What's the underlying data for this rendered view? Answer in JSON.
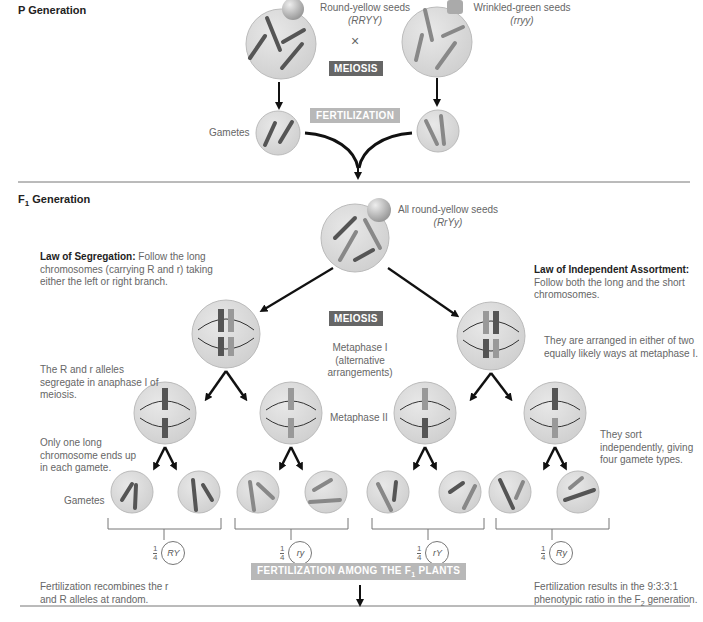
{
  "p_generation": {
    "title": "P Generation",
    "parent1": {
      "label": "Round-yellow seeds",
      "genotype": "(RRYY)"
    },
    "parent2": {
      "label": "Wrinkled-green seeds",
      "genotype": "(rryy)"
    },
    "cross_symbol": "×",
    "meiosis_label": "MEIOSIS",
    "fertilization_label": "FERTILIZATION",
    "gametes_label": "Gametes",
    "gamete1_alleles": [
      "R",
      "Y"
    ],
    "gamete2_alleles": [
      "y",
      "r"
    ]
  },
  "f1_generation": {
    "title_prefix": "F",
    "title_sub": "1",
    "title_suffix": " Generation",
    "offspring": {
      "label": "All round-yellow seeds",
      "genotype": "(RrYy)"
    },
    "law_segregation": {
      "heading": "Law of Segregation:",
      "text": "Follow the long chromosomes (carrying R and r) taking either the left or right branch."
    },
    "law_independent": {
      "heading": "Law of Independent Assortment:",
      "text": "Follow both the long and the short chromosomes."
    },
    "meiosis_label": "MEIOSIS",
    "metaphase1_label": "Metaphase I (alternative arrangements)",
    "metaphase2_label": "Metaphase II",
    "segregate_note": "The R and r alleles segregate in anaphase I of meiosis.",
    "arranged_note": "They are arranged in either of two equally likely ways at metaphase I.",
    "one_long_note": "Only one long chromosome ends up in each gamete.",
    "sort_note": "They sort independently, giving four gamete types.",
    "gametes_label": "Gametes",
    "gamete_types": [
      {
        "fraction_num": "1",
        "fraction_den": "4",
        "genotype": "RY"
      },
      {
        "fraction_num": "1",
        "fraction_den": "4",
        "genotype": "ry"
      },
      {
        "fraction_num": "1",
        "fraction_den": "4",
        "genotype": "rY"
      },
      {
        "fraction_num": "1",
        "fraction_den": "4",
        "genotype": "Ry"
      }
    ],
    "fertilization_among_prefix": "FERTILIZATION AMONG THE F",
    "fertilization_among_sub": "1",
    "fertilization_among_suffix": " PLANTS",
    "recombine_note": "Fertilization recombines the r and R alleles at random.",
    "ratio_note_prefix": "Fertilization results in the 9:3:3:1 phenotypic ratio in the F",
    "ratio_note_sub": "2",
    "ratio_note_suffix": " generation."
  },
  "colors": {
    "cell_fill": "#d9d9d9",
    "cell_stroke": "#b5b5b5",
    "chrom_dark": "#555555",
    "chrom_light": "#8a8a8a",
    "arrow": "#111111",
    "rule": "#777777",
    "badge_dark": "#666666",
    "badge_light": "#b8b8b8"
  }
}
